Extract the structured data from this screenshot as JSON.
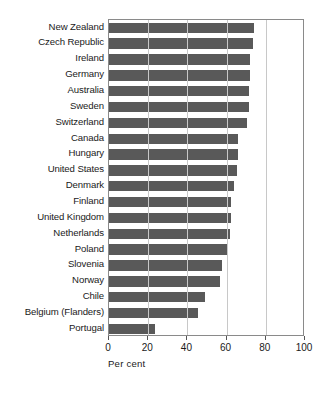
{
  "chart_data": {
    "type": "bar",
    "orientation": "horizontal",
    "title": "",
    "xlabel": "Per cent",
    "ylabel": "",
    "xlim": [
      0,
      100
    ],
    "xticks": [
      0,
      20,
      40,
      60,
      80,
      100
    ],
    "xtick_labels": [
      "0",
      "20",
      "40",
      "60",
      "80",
      "100"
    ],
    "grid": true,
    "grid_axis": "x",
    "legend": false,
    "bar_color": "#595959",
    "categories": [
      "New Zealand",
      "Czech Republic",
      "Ireland",
      "Germany",
      "Australia",
      "Sweden",
      "Switzerland",
      "Canada",
      "Hungary",
      "United States",
      "Denmark",
      "Finland",
      "United Kingdom",
      "Netherlands",
      "Poland",
      "Slovenia",
      "Norway",
      "Chile",
      "Belgium (Flanders)",
      "Portugal"
    ],
    "values": [
      74.0,
      73.5,
      72.0,
      72.0,
      71.5,
      71.5,
      70.5,
      66.0,
      66.0,
      65.5,
      64.0,
      62.0,
      62.0,
      61.5,
      60.5,
      57.5,
      56.5,
      49.0,
      45.5,
      23.5
    ]
  }
}
